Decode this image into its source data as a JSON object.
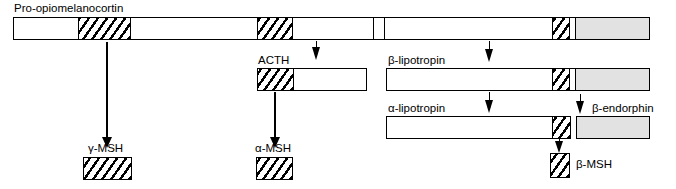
{
  "figure": {
    "type": "protein-cleavage-diagram",
    "colors": {
      "outline": "#000000",
      "fill_plain": "#ffffff",
      "fill_gray": "#e2e2e2",
      "hatch": "#000000"
    }
  },
  "labels": {
    "pomc": "Pro-opiomelanocortin",
    "acth": "ACTH",
    "beta_lipotropin": "β-lipotropin",
    "alpha_lipotropin": "α-lipotropin",
    "beta_endorphin": "β-endorphin",
    "gamma_msh": "γ-MSH",
    "alpha_msh": "α-MSH",
    "beta_msh": "β-MSH"
  },
  "rows": [
    {
      "name": "pro-opiomelanocortin",
      "label": "Pro-opiomelanocortin",
      "segments": [
        {
          "name": "n-terminal-fragment",
          "style": "plain"
        },
        {
          "name": "gamma-msh-segment",
          "style": "hatch"
        },
        {
          "name": "joining-peptide",
          "style": "plain"
        },
        {
          "name": "alpha-msh-segment",
          "style": "hatch"
        },
        {
          "name": "acth-c-terminal",
          "style": "plain"
        },
        {
          "name": "spacer-1",
          "style": "plain"
        },
        {
          "name": "beta-lipotropin-n-terminal",
          "style": "plain"
        },
        {
          "name": "beta-msh-segment",
          "style": "hatch"
        },
        {
          "name": "spacer-2",
          "style": "plain"
        },
        {
          "name": "beta-endorphin-segment",
          "style": "gray"
        }
      ]
    },
    {
      "name": "acth",
      "label": "ACTH",
      "segments": [
        {
          "name": "alpha-msh-segment",
          "style": "hatch"
        },
        {
          "name": "acth-c-terminal",
          "style": "plain"
        }
      ]
    },
    {
      "name": "beta-lipotropin",
      "label": "β-lipotropin",
      "segments": [
        {
          "name": "alpha-lipotropin-body",
          "style": "plain"
        },
        {
          "name": "beta-msh-segment",
          "style": "hatch"
        },
        {
          "name": "spacer",
          "style": "plain"
        },
        {
          "name": "beta-endorphin-segment",
          "style": "gray"
        }
      ]
    },
    {
      "name": "alpha-lipotropin",
      "label": "α-lipotropin",
      "segments": [
        {
          "name": "alpha-lipotropin-body",
          "style": "plain"
        },
        {
          "name": "beta-msh-segment",
          "style": "hatch"
        }
      ]
    },
    {
      "name": "beta-endorphin",
      "label": "β-endorphin",
      "segments": [
        {
          "name": "beta-endorphin-body",
          "style": "gray"
        }
      ]
    }
  ],
  "products": [
    {
      "name": "gamma-msh",
      "label": "γ-MSH",
      "style": "hatch"
    },
    {
      "name": "alpha-msh",
      "label": "α-MSH",
      "style": "hatch"
    },
    {
      "name": "beta-msh",
      "label": "β-MSH",
      "style": "hatch"
    }
  ]
}
